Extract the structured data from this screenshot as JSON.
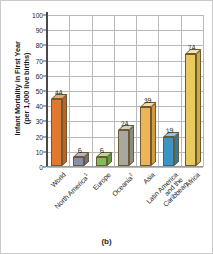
{
  "chart_data": {
    "type": "bar",
    "title": "",
    "xlabel": "",
    "ylabel": "Infant Mortality in First Year (per 1,000 live births)",
    "ylabel_line1": "Infant Mortality in First Year",
    "ylabel_line2": "(per 1,000 live births)",
    "ylim": [
      0,
      100
    ],
    "ytick_step": 10,
    "grid": true,
    "legend": "none",
    "categories": [
      "World",
      "North America",
      "Europe",
      "Oceania",
      "Asia",
      "Latin America and the Caribbean",
      "Africa"
    ],
    "values": [
      44,
      6,
      6,
      24,
      39,
      19,
      74
    ],
    "ytick_labels": [
      "0",
      "10",
      "20",
      "30",
      "40",
      "50",
      "60",
      "70",
      "80",
      "90",
      "100"
    ],
    "bar_colors": [
      "#E2782E",
      "#8B8BAE",
      "#7DBE56",
      "#A8A8A0",
      "#EDB458",
      "#3C94C4",
      "#E8CA5E"
    ],
    "bar_top_colors": [
      "#F3A86B",
      "#B5B5D0",
      "#B6DC9A",
      "#D0D0C8",
      "#F6DCAD",
      "#8FC6E4",
      "#F4E6AC"
    ],
    "bar_side_colors": [
      "#C4611F",
      "#6E6E94",
      "#5CA13C",
      "#8C8C85",
      "#D59A3E",
      "#2B7CA8",
      "#CDAE3E"
    ],
    "annotations": [
      "44",
      "6",
      "6",
      "24",
      "39",
      "19",
      "74"
    ],
    "caption": "(b)"
  },
  "labels": {
    "north_america_marker": "",
    "oceania_marker": ""
  }
}
